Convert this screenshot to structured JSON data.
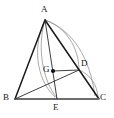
{
  "figure": {
    "width": 114,
    "height": 118,
    "background_color": "#ffffff",
    "stroke_color_main": "#1a1a1a",
    "stroke_color_arc": "#8f8f8f",
    "stroke_color_base": "#6e6e6e",
    "point_color": "#111111"
  },
  "vertices": {
    "A": {
      "label": "A",
      "x": 45,
      "y": 20,
      "label_x": 41,
      "label_y": 7
    },
    "B": {
      "label": "B",
      "x": 15,
      "y": 99,
      "label_x": 4,
      "label_y": 98
    },
    "C": {
      "label": "C",
      "x": 99,
      "y": 99,
      "label_x": 100,
      "label_y": 98
    },
    "D": {
      "label": "D",
      "x": 79,
      "y": 70,
      "label_x": 81,
      "label_y": 62
    },
    "E": {
      "label": "E",
      "x": 57,
      "y": 99,
      "label_x": 54,
      "label_y": 103
    },
    "G": {
      "label": "G",
      "x": 53,
      "y": 71,
      "label_x": 43,
      "label_y": 66
    }
  },
  "segments": [
    {
      "name": "side-AB",
      "from": "A",
      "to": "B",
      "style": "solid-dark",
      "width": 1.4
    },
    {
      "name": "side-BC",
      "from": "B",
      "to": "C",
      "style": "solid-base",
      "width": 2.0
    },
    {
      "name": "side-AC",
      "from": "A",
      "to": "C",
      "style": "solid-dark",
      "width": 1.4
    },
    {
      "name": "cevian-AE",
      "from": "A",
      "to": "E",
      "style": "solid-thin",
      "width": 0.9
    },
    {
      "name": "cevian-BD",
      "from": "B",
      "to": "D",
      "style": "solid-thin",
      "width": 0.9
    },
    {
      "name": "segment-GD",
      "from": "G",
      "to": "D",
      "style": "solid-thin",
      "width": 0.9
    }
  ],
  "arcs": [
    {
      "name": "arc-A-to-E",
      "from": "A",
      "to": "E",
      "sweep": "left",
      "color": "#8f8f8f"
    },
    {
      "name": "arc-A-to-C",
      "from": "A",
      "to": "C",
      "sweep": "right",
      "color": "#8f8f8f"
    },
    {
      "name": "arc-D-to-C",
      "from": "D",
      "to": "C",
      "sweep": "right",
      "color": "#8f8f8f"
    },
    {
      "name": "arc-A-to-D",
      "from": "A",
      "to": "D",
      "sweep": "right",
      "color": "#8f8f8f"
    }
  ],
  "points": [
    {
      "name": "point-G-dot",
      "at": "G",
      "radius": 2.0,
      "filled": true
    }
  ]
}
